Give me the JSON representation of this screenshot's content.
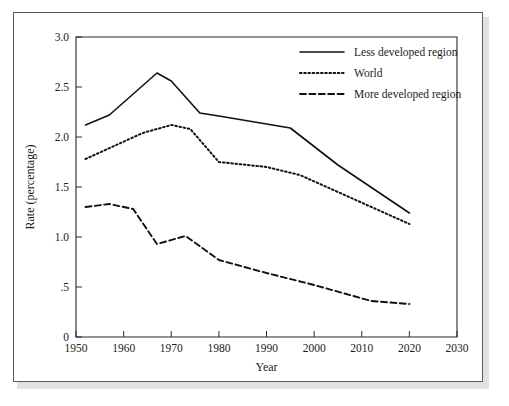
{
  "chart_data": {
    "type": "line",
    "title": "",
    "subtitle": "",
    "xlabel": "Year",
    "ylabel": "Rate (percentage)",
    "xlim": [
      1950,
      2030
    ],
    "ylim": [
      0,
      3.0
    ],
    "xticks": [
      1950,
      1960,
      1970,
      1980,
      1990,
      2000,
      2010,
      2020,
      2030
    ],
    "xtick_labels": [
      "1950",
      "1960",
      "1970",
      "1980",
      "1990",
      "2000",
      "2010",
      "2020",
      "2030"
    ],
    "yticks": [
      0,
      0.5,
      1.0,
      1.5,
      2.0,
      2.5,
      3.0
    ],
    "ytick_labels": [
      "0",
      ".5",
      "1.0",
      "1.5",
      "2.0",
      "2.5",
      "3.0"
    ],
    "grid": false,
    "legend_position": "top-right",
    "series": [
      {
        "name": "Less developed region",
        "style": "solid",
        "color": "#111111",
        "x": [
          1952,
          1957,
          1967,
          1970,
          1976,
          1980,
          1990,
          1995,
          2005,
          2020
        ],
        "values": [
          2.12,
          2.22,
          2.64,
          2.56,
          2.24,
          2.21,
          2.13,
          2.09,
          1.72,
          1.24
        ]
      },
      {
        "name": "World",
        "style": "dotted",
        "color": "#111111",
        "x": [
          1952,
          1958,
          1964,
          1970,
          1974,
          1980,
          1990,
          1997,
          2005,
          2020
        ],
        "values": [
          1.78,
          1.91,
          2.04,
          2.12,
          2.08,
          1.75,
          1.7,
          1.62,
          1.45,
          1.13
        ]
      },
      {
        "name": "More developed region",
        "style": "dashed",
        "color": "#111111",
        "x": [
          1952,
          1957,
          1962,
          1967,
          1973,
          1980,
          1990,
          2000,
          2012,
          2020
        ],
        "values": [
          1.3,
          1.33,
          1.28,
          0.93,
          1.01,
          0.77,
          0.64,
          0.52,
          0.36,
          0.33
        ]
      }
    ]
  },
  "legend": {
    "items": [
      {
        "label": "Less developed region",
        "style": "solid"
      },
      {
        "label": "World",
        "style": "dotted"
      },
      {
        "label": "More developed region",
        "style": "dashed"
      }
    ]
  },
  "axes": {
    "x_title": "Year",
    "y_title": "Rate (percentage)"
  }
}
